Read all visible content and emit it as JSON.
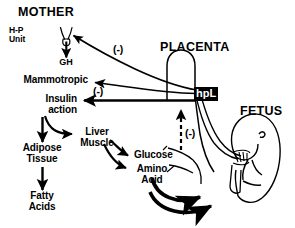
{
  "figure": {
    "title_sections": {
      "mother": "MOTHER",
      "placenta": "PLACENTA",
      "fetus": "FETUS"
    },
    "nodes": {
      "hp_unit": "H-P\nUnit",
      "gh": "GH",
      "mammotropic": "Mammotropic",
      "insulin_action": "Insulin\naction",
      "liver_muscle": "Liver\nMuscle",
      "adipose_tissue": "Adipose\nTissue",
      "fatty_acids": "Fatty\nAcids",
      "glucose": "Glucose",
      "amino_acid": "Amino\nAcid",
      "hpl": "hpL"
    },
    "signs": {
      "neg_gh_feedback": "(-)",
      "neg_insulin": "(-)",
      "neg_fetal_feedback": "(-)"
    },
    "colors": {
      "ink": "#000000",
      "paper": "#ffffff",
      "hpl_box_bg": "#000000",
      "hpl_box_text": "#ffffff"
    },
    "icons": {
      "hp_unit": "hypothalamus-pituitary-icon",
      "placenta": "placenta-outline-icon",
      "fetus": "fetus-outline-icon",
      "umbilical_cord": "umbilical-cord-icon"
    }
  }
}
